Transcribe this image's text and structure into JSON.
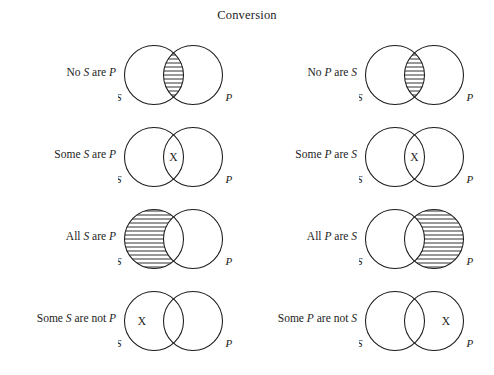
{
  "figure": {
    "title": "Conversion",
    "label_left": "S",
    "label_right": "P",
    "x_mark": "X",
    "stroke_color": "#1a1a1a",
    "hatch_color": "#1a1a1a",
    "background": "#ffffff"
  },
  "rows": [
    {
      "left": {
        "label_html": "No <i>S</i> are <i>P</i>",
        "label_text": "No S are P",
        "shaded": "overlap",
        "x_region": "none"
      },
      "right": {
        "label_html": "No <i>P</i> are <i>S</i>",
        "label_text": "No P are S",
        "shaded": "overlap",
        "x_region": "none"
      }
    },
    {
      "left": {
        "label_html": "Some <i>S</i> are <i>P</i>",
        "label_text": "Some S are P",
        "shaded": "none",
        "x_region": "overlap"
      },
      "right": {
        "label_html": "Some <i>P</i> are <i>S</i>",
        "label_text": "Some P are S",
        "shaded": "none",
        "x_region": "overlap"
      }
    },
    {
      "left": {
        "label_html": "All <i>S</i> are <i>P</i>",
        "label_text": "All S are P",
        "shaded": "left-only",
        "x_region": "none"
      },
      "right": {
        "label_html": "All <i>P</i> are <i>S</i>",
        "label_text": "All P are S",
        "shaded": "right-only",
        "x_region": "none"
      }
    },
    {
      "left": {
        "label_html": "Some <i>S</i> are not <i>P</i>",
        "label_text": "Some S are not P",
        "shaded": "none",
        "x_region": "left-only"
      },
      "right": {
        "label_html": "Some <i>P</i> are not <i>S</i>",
        "label_text": "Some P are not S",
        "shaded": "none",
        "x_region": "right-only"
      }
    }
  ]
}
